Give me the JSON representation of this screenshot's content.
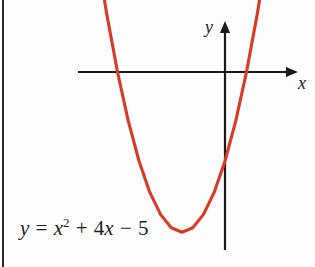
{
  "figure": {
    "name": "parabola-graph",
    "background_color": "#fdfdfe",
    "border_color": "#2b2a28",
    "width": 315,
    "height": 267
  },
  "axes": {
    "x_label": "x",
    "y_label": "y",
    "axis_color": "#1a1a1a",
    "x_axis_pixel_y": 72,
    "y_axis_pixel_x": 225
  },
  "equation": {
    "lhs": "y",
    "equals": "=",
    "term1_var": "x",
    "term1_exponent": "2",
    "plus": "+",
    "term2_coefficient": "4",
    "term2_var": "x",
    "minus": "−",
    "constant": "5",
    "full_text": "y = x² + 4x − 5"
  },
  "chart_data": {
    "type": "line",
    "title": "",
    "subtitle": "",
    "xlabel": "x",
    "ylabel": "y",
    "curve_color": "#d93a23",
    "grid": false,
    "legend": null,
    "annotations": [
      "y = x² + 4x − 5"
    ],
    "function": "y = x^2 + 4x - 5",
    "coefficients": {
      "a": 1,
      "b": 4,
      "c": -5
    },
    "vertex": {
      "x": -2,
      "y": -9
    },
    "roots": [
      -5,
      1
    ],
    "y_intercept": -5,
    "axis_of_symmetry": -2,
    "xlim": [
      -7.2,
      3.6
    ],
    "ylim": [
      -11.5,
      6.2
    ],
    "x": [
      -6.3,
      -6.0,
      -5.5,
      -5.0,
      -4.5,
      -4.0,
      -3.5,
      -3.0,
      -2.5,
      -2.0,
      -1.5,
      -1.0,
      -0.5,
      0.0,
      0.5,
      1.0,
      1.5,
      2.0,
      2.3
    ],
    "y": [
      10.09,
      7.0,
      3.25,
      0.0,
      -2.75,
      -5.0,
      -6.75,
      -8.0,
      -8.75,
      -9.0,
      -8.75,
      -8.0,
      -6.75,
      -5.0,
      -2.75,
      0.0,
      3.25,
      7.0,
      9.49
    ]
  }
}
